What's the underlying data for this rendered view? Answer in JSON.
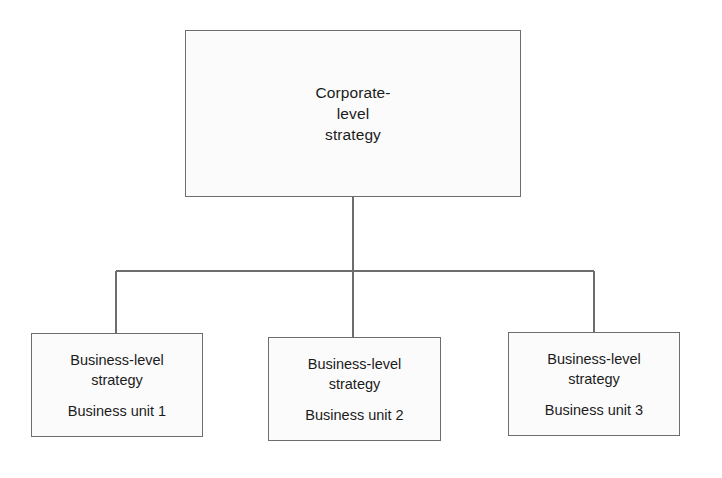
{
  "diagram": {
    "line_color": "#6d6d6d",
    "box_fill": "#fbfbfb",
    "text_color": "#1b1b1b",
    "background": "#ffffff",
    "root": {
      "line_1": "Corporate-",
      "line_2": "level",
      "line_3": "strategy"
    },
    "units": [
      {
        "strategy_line_1": "Business-level",
        "strategy_line_2": "strategy",
        "unit_label": "Business unit 1"
      },
      {
        "strategy_line_1": "Business-level",
        "strategy_line_2": "strategy",
        "unit_label": "Business unit 2"
      },
      {
        "strategy_line_1": "Business-level",
        "strategy_line_2": "strategy",
        "unit_label": "Business unit 3"
      }
    ]
  }
}
